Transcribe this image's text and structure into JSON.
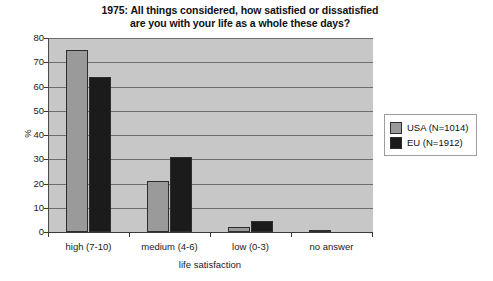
{
  "chart_data": {
    "type": "bar",
    "title": "1975: All things considered, how satisfied or dissatisfied are you with your life as a whole these days?",
    "title_line1": "1975: All things considered, how satisfied or dissatisfied",
    "title_line2": "are you with your life as a whole these days?",
    "xlabel": "life satisfaction",
    "ylabel": "%",
    "ylim": [
      0,
      80
    ],
    "yticks": [
      0,
      10,
      20,
      30,
      40,
      50,
      60,
      70,
      80
    ],
    "grid": true,
    "legend_position": "right",
    "categories": [
      "high (7-10)",
      "medium (4-6)",
      "low (0-3)",
      "no answer"
    ],
    "series": [
      {
        "name": "USA (N=1014)",
        "color": "#9a9a9a",
        "values": [
          75,
          21,
          2,
          1
        ]
      },
      {
        "name": "EU (N=1912)",
        "color": "#1b1b1b",
        "values": [
          64,
          31,
          4.5,
          0
        ]
      }
    ]
  },
  "legend": {
    "items": [
      {
        "label": "USA (N=1014)",
        "swatch": "usa"
      },
      {
        "label": "EU (N=1912)",
        "swatch": "eu"
      }
    ]
  },
  "axes": {
    "y_tick_labels": [
      "80",
      "70",
      "60",
      "50",
      "40",
      "30",
      "20",
      "10",
      "0"
    ],
    "y_axis_title": "%",
    "x_axis_title": "life satisfaction",
    "x_tick_labels": [
      "high (7-10)",
      "medium (4-6)",
      "low (0-3)",
      "no answer"
    ]
  }
}
